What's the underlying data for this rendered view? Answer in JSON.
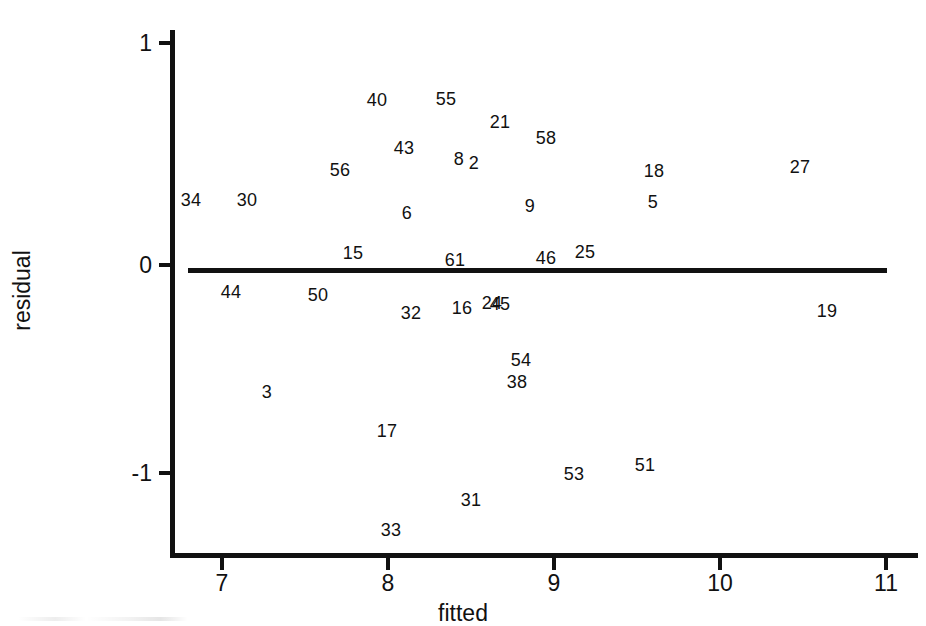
{
  "chart_data": {
    "type": "scatter",
    "title": "",
    "subtitle": "",
    "xlabel": "fitted",
    "ylabel": "residual",
    "xlim": [
      6.7,
      11.0
    ],
    "ylim": [
      -1.2,
      1.05
    ],
    "xticks": [
      7,
      8,
      9,
      10,
      11
    ],
    "xticklabels": [
      "7",
      "8",
      "9",
      "10",
      "11"
    ],
    "yticks": [
      1,
      0,
      -1
    ],
    "yticklabels": [
      "1",
      "0",
      "-1"
    ],
    "grid": false,
    "legend": null,
    "marker_style": "case-number-labels",
    "annotations": [
      {
        "text": "zero reference line",
        "type": "hline",
        "y": 0,
        "x_start": 6.8,
        "x_end": 11.0
      }
    ],
    "points": [
      {
        "label": "34",
        "x": 6.81,
        "y": 0.302,
        "px": 191,
        "py": 200
      },
      {
        "label": "30",
        "x": 7.15,
        "y": 0.302,
        "px": 247,
        "py": 200
      },
      {
        "label": "56",
        "x": 7.71,
        "y": 0.442,
        "px": 340,
        "py": 170
      },
      {
        "label": "40",
        "x": 7.93,
        "y": 0.767,
        "px": 377,
        "py": 100
      },
      {
        "label": "43",
        "x": 8.1,
        "y": 0.544,
        "px": 404,
        "py": 148
      },
      {
        "label": "6",
        "x": 8.11,
        "y": 0.242,
        "px": 407,
        "py": 213
      },
      {
        "label": "55",
        "x": 8.35,
        "y": 0.772,
        "px": 446,
        "py": 99
      },
      {
        "label": "8",
        "x": 8.43,
        "y": 0.493,
        "px": 459,
        "py": 159
      },
      {
        "label": "2",
        "x": 8.52,
        "y": 0.474,
        "px": 474,
        "py": 163
      },
      {
        "label": "21",
        "x": 8.67,
        "y": 0.665,
        "px": 500,
        "py": 122
      },
      {
        "label": "9",
        "x": 8.86,
        "y": 0.274,
        "px": 530,
        "py": 206
      },
      {
        "label": "58",
        "x": 8.95,
        "y": 0.591,
        "px": 546,
        "py": 138
      },
      {
        "label": "18",
        "x": 9.6,
        "y": 0.437,
        "px": 654,
        "py": 171
      },
      {
        "label": "5",
        "x": 9.59,
        "y": 0.293,
        "px": 653,
        "py": 202
      },
      {
        "label": "27",
        "x": 10.47,
        "y": 0.456,
        "px": 800,
        "py": 167
      },
      {
        "label": "15",
        "x": 7.79,
        "y": 0.056,
        "px": 353,
        "py": 253
      },
      {
        "label": "61",
        "x": 8.4,
        "y": 0.023,
        "px": 455,
        "py": 260
      },
      {
        "label": "46",
        "x": 8.95,
        "y": 0.033,
        "px": 546,
        "py": 258
      },
      {
        "label": "25",
        "x": 9.19,
        "y": 0.06,
        "px": 585,
        "py": 252
      },
      {
        "label": "44",
        "x": 7.05,
        "y": -0.126,
        "px": 231,
        "py": 292
      },
      {
        "label": "50",
        "x": 7.58,
        "y": -0.14,
        "px": 318,
        "py": 295
      },
      {
        "label": "32",
        "x": 8.13,
        "y": -0.223,
        "px": 411,
        "py": 313
      },
      {
        "label": "16",
        "x": 8.44,
        "y": -0.2,
        "px": 462,
        "py": 308
      },
      {
        "label": "24",
        "x": 8.62,
        "y": -0.177,
        "px": 492,
        "py": 303
      },
      {
        "label": "45",
        "x": 8.67,
        "y": -0.181,
        "px": 500,
        "py": 304
      },
      {
        "label": "19",
        "x": 10.63,
        "y": -0.214,
        "px": 827,
        "py": 311
      },
      {
        "label": "54",
        "x": 8.79,
        "y": -0.349,
        "px": 521,
        "py": 360
      },
      {
        "label": "38",
        "x": 8.76,
        "y": -0.451,
        "px": 517,
        "py": 382
      },
      {
        "label": "3",
        "x": 7.25,
        "y": -0.498,
        "px": 267,
        "py": 392
      },
      {
        "label": "17",
        "x": 7.97,
        "y": -0.633,
        "px": 387,
        "py": 431
      },
      {
        "label": "53",
        "x": 9.12,
        "y": -0.823,
        "px": 574,
        "py": 474
      },
      {
        "label": "51",
        "x": 9.5,
        "y": -0.856,
        "px": 645,
        "py": 465
      },
      {
        "label": "31",
        "x": 8.49,
        "y": -0.963,
        "px": 471,
        "py": 500
      },
      {
        "label": "33",
        "x": 8.0,
        "y": -1.084,
        "px": 391,
        "py": 530
      }
    ]
  },
  "axes": {
    "x": {
      "label": "fitted",
      "ticks": [
        {
          "value": "7",
          "px": 222
        },
        {
          "value": "8",
          "px": 388
        },
        {
          "value": "9",
          "px": 554
        },
        {
          "value": "10",
          "px": 720
        },
        {
          "value": "11",
          "px": 886
        }
      ]
    },
    "y": {
      "label": "residual",
      "ticks": [
        {
          "value": "1",
          "py": 43
        },
        {
          "value": "0",
          "py": 265
        },
        {
          "value": "-1",
          "py": 473
        }
      ]
    }
  },
  "colors": {
    "ink": "#111111",
    "background": "#ffffff"
  }
}
